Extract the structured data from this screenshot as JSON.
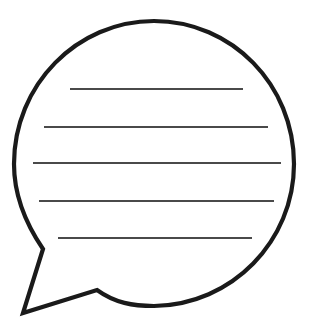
{
  "canvas": {
    "width": 314,
    "height": 334,
    "background": "#ffffff",
    "title": "Blank speech bubble with ruled text lines"
  },
  "illustration": {
    "name": "speech-bubble",
    "description": "Outlined oval speech balloon with a pointed tail at lower left and five horizontal ruled writing lines inside",
    "outline_color": "#1a1a1a",
    "fill_color": "#ffffff",
    "outline_width": 4.2,
    "body": {
      "shape": "ellipse",
      "center_x": 154,
      "center_y": 164,
      "radius_x": 140,
      "radius_y": 143
    },
    "tail": {
      "name": "speech-bubble-tail",
      "apex_x": 23,
      "apex_y": 313,
      "attach_upper_x": 25,
      "attach_upper_y": 229,
      "bend_x": 43,
      "bend_y": 249,
      "notch_x": 97,
      "notch_y": 290,
      "attach_lower_x": 133,
      "attach_lower_y": 300
    },
    "path": "M 294 164 C 294 241 232 305 154 306 C 133 306 115 303 97 290 L 23 313 L 43 249 C 28 227 14 197 14 164 C 14 85 77 21 154 21 C 232 21 294 85 294 164 Z"
  },
  "ruled_lines": {
    "count": 5,
    "color": "#4a4a4a",
    "stroke_width": 1.9,
    "items": [
      {
        "id": "line-1",
        "x1": 70,
        "y1": 89,
        "x2": 243,
        "y2": 89,
        "length": 173
      },
      {
        "id": "line-2",
        "x1": 44,
        "y1": 127,
        "x2": 268,
        "y2": 127,
        "length": 224
      },
      {
        "id": "line-3",
        "x1": 33,
        "y1": 163,
        "x2": 281,
        "y2": 163,
        "length": 248
      },
      {
        "id": "line-4",
        "x1": 39,
        "y1": 201,
        "x2": 274,
        "y2": 201,
        "length": 235
      },
      {
        "id": "line-5",
        "x1": 58,
        "y1": 238,
        "x2": 252,
        "y2": 238,
        "length": 194
      }
    ]
  }
}
